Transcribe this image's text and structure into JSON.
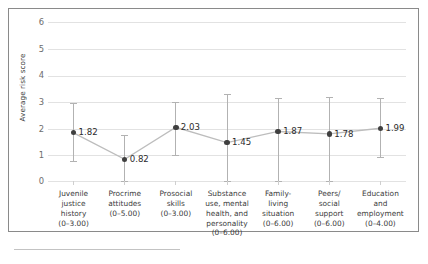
{
  "chart_data": {
    "type": "line",
    "title": "",
    "xlabel": "",
    "ylabel": "Average risk score",
    "ylim": [
      0,
      6
    ],
    "yticks": [
      "0",
      "1",
      "2",
      "3",
      "4",
      "5",
      "6"
    ],
    "grid": true,
    "legend": "none",
    "categories": [
      "Juvenile\njustice\nhistory\n(0–3.00)",
      "Procrime\nattitudes\n(0–5.00)",
      "Prosocial\nskills\n(0–3.00)",
      "Substance\nuse, mental\nhealth, and\npersonality\n(0–6.00)",
      "Family-\nliving\nsituation\n(0–6.00)",
      "Peers/\nsocial\nsupport\n(0–6.00)",
      "Education\nand\nemployment\n(0–4.00)"
    ],
    "category_names": [
      "Juvenile justice history",
      "Procrime attitudes",
      "Prosocial skills",
      "Substance use, mental health, and personality",
      "Family-living situation",
      "Peers/social support",
      "Education and employment"
    ],
    "category_ranges": [
      "(0–3.00)",
      "(0–5.00)",
      "(0–3.00)",
      "(0–6.00)",
      "(0–6.00)",
      "(0–6.00)",
      "(0–4.00)"
    ],
    "values": [
      1.82,
      0.82,
      2.03,
      1.45,
      1.87,
      1.78,
      1.99
    ],
    "value_labels": [
      "1.82",
      "0.82",
      "2.03",
      "1.45",
      "1.87",
      "1.78",
      "1.99"
    ],
    "error_low": [
      0.75,
      0.0,
      0.98,
      0.0,
      0.0,
      0.0,
      0.92
    ],
    "error_high": [
      2.95,
      1.72,
      2.98,
      3.28,
      3.15,
      3.18,
      3.12
    ],
    "marker_color": "#3f3f3f",
    "line_color": "#bdbdbd",
    "errorbar_color": "#b2b2b2",
    "grid_color": "#e2e2e2",
    "text_color": "#3b3b3b"
  }
}
